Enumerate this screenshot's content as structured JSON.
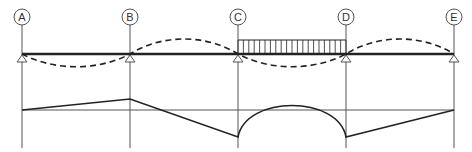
{
  "diagram": {
    "type": "continuous-beam-moment-diagram",
    "colors": {
      "line": "#222222",
      "grid": "#555555",
      "background": "#ffffff"
    },
    "gridlines": [
      {
        "label": "A",
        "x": 22
      },
      {
        "label": "B",
        "x": 130
      },
      {
        "label": "C",
        "x": 238
      },
      {
        "label": "D",
        "x": 346
      },
      {
        "label": "E",
        "x": 454
      }
    ],
    "beam": {
      "y": 54,
      "x_start": 22,
      "x_end": 454
    },
    "supports": [
      "A",
      "B",
      "C",
      "D",
      "E"
    ],
    "distributed_load": {
      "from": "C",
      "to": "D",
      "top_y": 40,
      "hatch_count": 20
    },
    "deflected_shape": {
      "style": "dashed",
      "spans": [
        {
          "from": "A",
          "to": "B",
          "direction": "down"
        },
        {
          "from": "B",
          "to": "C",
          "direction": "up"
        },
        {
          "from": "C",
          "to": "D",
          "direction": "down"
        },
        {
          "from": "D",
          "to": "E",
          "direction": "up"
        }
      ]
    },
    "moment_diagram": {
      "baseline_y": 110,
      "points": [
        {
          "at": "A",
          "y": 110
        },
        {
          "at": "B",
          "y": 99
        },
        {
          "at": "C",
          "y": 137
        },
        {
          "at": "mid-CD",
          "y": 97,
          "shape": "arc"
        },
        {
          "at": "D",
          "y": 137
        },
        {
          "at": "E",
          "y": 110
        }
      ]
    }
  }
}
